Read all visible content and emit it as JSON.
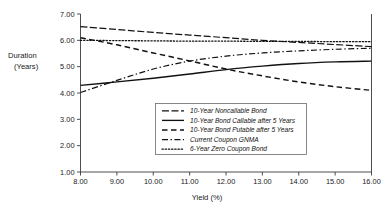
{
  "chart_data": {
    "type": "line",
    "title": "",
    "xlabel": "Yield (%)",
    "ylabel": "Duration (Years)",
    "ylabel_line1": "Duration",
    "ylabel_line2": "(Years)",
    "xlim": [
      8.0,
      16.0
    ],
    "ylim": [
      1.0,
      7.0
    ],
    "grid": false,
    "legend_position": "center-bottom-inside",
    "xticks": [
      8.0,
      9.0,
      10.0,
      11.0,
      12.0,
      13.0,
      14.0,
      15.0,
      16.0
    ],
    "xtick_labels": [
      "8.00",
      "9.00",
      "10.00",
      "11.00",
      "12.00",
      "13.00",
      "14.00",
      "15.00",
      "16.00"
    ],
    "yticks": [
      1.0,
      2.0,
      3.0,
      4.0,
      5.0,
      6.0,
      7.0
    ],
    "ytick_labels": [
      "1.00",
      "2.00",
      "3.00",
      "4.00",
      "5.00",
      "6.00",
      "7.00"
    ],
    "x": [
      8.0,
      9.0,
      10.0,
      11.0,
      12.0,
      13.0,
      14.0,
      15.0,
      16.0
    ],
    "series": [
      {
        "name": "10-Year Noncallable Bond",
        "dash": "long-dash",
        "dasharray": "7,2.5",
        "width": 1.2,
        "values": [
          6.52,
          6.41,
          6.3,
          6.2,
          6.1,
          6.0,
          5.92,
          5.84,
          5.76
        ]
      },
      {
        "name": "10-Year Bond Callable after 5 Years",
        "dash": "solid",
        "dasharray": "none",
        "width": 1.35,
        "values": [
          4.29,
          4.42,
          4.56,
          4.72,
          4.89,
          5.02,
          5.12,
          5.18,
          5.21
        ]
      },
      {
        "name": "10-Year Bond Putable after 5 Years",
        "dash": "dash",
        "dasharray": "5.5,3.5",
        "width": 1.45,
        "values": [
          6.1,
          5.83,
          5.52,
          5.22,
          4.91,
          4.65,
          4.42,
          4.24,
          4.1
        ]
      },
      {
        "name": "Current Coupon GNMA",
        "dash": "dash-dot",
        "dasharray": "6,2.5,1.4,2.5",
        "width": 1.2,
        "values": [
          4.02,
          4.48,
          4.91,
          5.21,
          5.4,
          5.52,
          5.6,
          5.66,
          5.7
        ]
      },
      {
        "name": "6-Year Zero Coupon Bond",
        "dash": "dotted",
        "dasharray": "1.3,1.9",
        "width": 1.3,
        "values": [
          6.0,
          5.99,
          5.98,
          5.97,
          5.97,
          5.96,
          5.96,
          5.95,
          5.95
        ]
      }
    ]
  },
  "axes": {
    "y_title_line1": "Duration",
    "y_title_line2": "(Years)",
    "x_title": "Yield (%)"
  },
  "legend": {
    "entries": [
      {
        "label": "10-Year Noncallable Bond"
      },
      {
        "label": "10-Year Bond Callable after 5 Years"
      },
      {
        "label": "10-Year Bond Putable after 5 Years"
      },
      {
        "label": "Current Coupon GNMA"
      },
      {
        "label": "6-Year Zero Coupon Bond"
      }
    ]
  },
  "colors": {
    "line": "#111111",
    "axis": "#3a3a3a",
    "background": "#ffffff",
    "legend_border": "#6a6a6a"
  }
}
